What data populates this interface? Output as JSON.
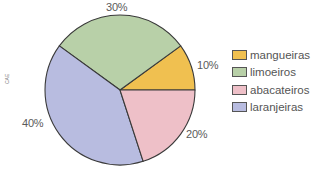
{
  "chart_data": {
    "type": "pie",
    "title": "",
    "categories": [
      "mangueiras",
      "limoeiros",
      "laranjeiras",
      "abacateiros"
    ],
    "values": [
      10,
      30,
      40,
      20
    ],
    "value_labels": [
      "10%",
      "30%",
      "40%",
      "20%"
    ],
    "colors": [
      "#F0C050",
      "#B8D0A8",
      "#B8BCE0",
      "#EEC0C8"
    ],
    "start_angle_deg": 0,
    "direction": "counterclockwise",
    "legend_position": "right",
    "legend": [
      {
        "label": "mangueiras",
        "color": "#F0C050"
      },
      {
        "label": "limoeiros",
        "color": "#B8D0A8"
      },
      {
        "label": "abacateiros",
        "color": "#EEC0C8"
      },
      {
        "label": "laranjeiras",
        "color": "#B8BCE0"
      }
    ]
  },
  "credit": "CAE"
}
